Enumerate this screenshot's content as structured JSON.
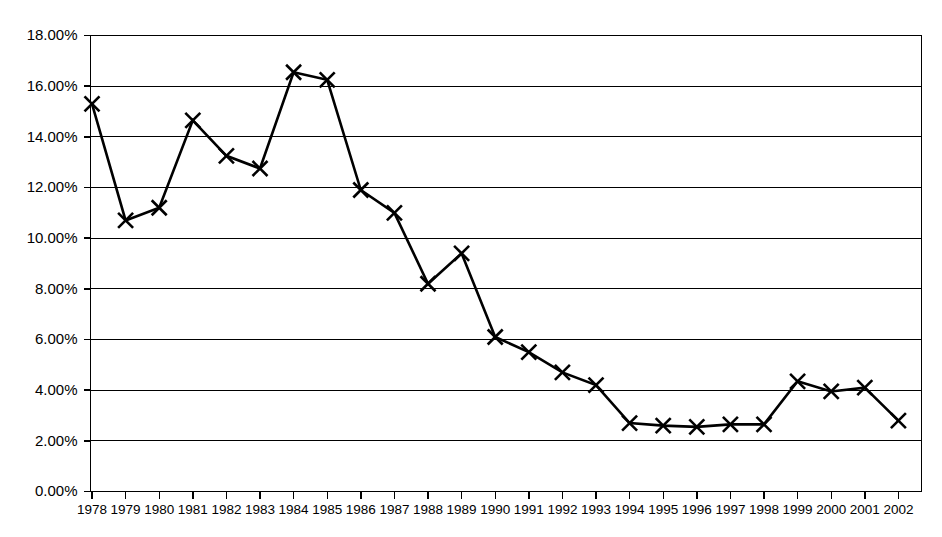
{
  "chart_data": {
    "type": "line",
    "title": "",
    "subtitle": "",
    "xlabel": "",
    "ylabel": "",
    "grid": true,
    "legend": false,
    "legend_position": "none",
    "marker": "x",
    "line_color": "#000000",
    "marker_color": "#000000",
    "background_color": "#ffffff",
    "ylim": [
      0,
      18
    ],
    "y_tick_step": 2,
    "y_unit": "%",
    "y_tick_labels": [
      "0.00%",
      "2.00%",
      "4.00%",
      "6.00%",
      "8.00%",
      "10.00%",
      "12.00%",
      "14.00%",
      "16.00%",
      "18.00%"
    ],
    "y_tick_values": [
      0,
      2,
      4,
      6,
      8,
      10,
      12,
      14,
      16,
      18
    ],
    "categories": [
      "1978",
      "1979",
      "1980",
      "1981",
      "1982",
      "1983",
      "1984",
      "1985",
      "1986",
      "1987",
      "1988",
      "1989",
      "1990",
      "1991",
      "1992",
      "1993",
      "1994",
      "1995",
      "1996",
      "1997",
      "1998",
      "1999",
      "2000",
      "2001",
      "2002"
    ],
    "x": [
      1978,
      1979,
      1980,
      1981,
      1982,
      1983,
      1984,
      1985,
      1986,
      1987,
      1988,
      1989,
      1990,
      1991,
      1992,
      1993,
      1994,
      1995,
      1996,
      1997,
      1998,
      1999,
      2000,
      2001,
      2002
    ],
    "values": [
      15.3,
      10.7,
      11.2,
      14.65,
      13.25,
      12.75,
      16.55,
      16.25,
      11.9,
      11.0,
      8.2,
      9.4,
      6.1,
      5.5,
      4.7,
      4.2,
      2.7,
      2.6,
      2.55,
      2.65,
      2.65,
      4.35,
      3.95,
      4.1,
      2.8
    ],
    "series": [
      {
        "name": "",
        "values": [
          15.3,
          10.7,
          11.2,
          14.65,
          13.25,
          12.75,
          16.55,
          16.25,
          11.9,
          11.0,
          8.2,
          9.4,
          6.1,
          5.5,
          4.7,
          4.2,
          2.7,
          2.6,
          2.55,
          2.65,
          2.65,
          4.35,
          3.95,
          4.1,
          2.8
        ]
      }
    ]
  }
}
